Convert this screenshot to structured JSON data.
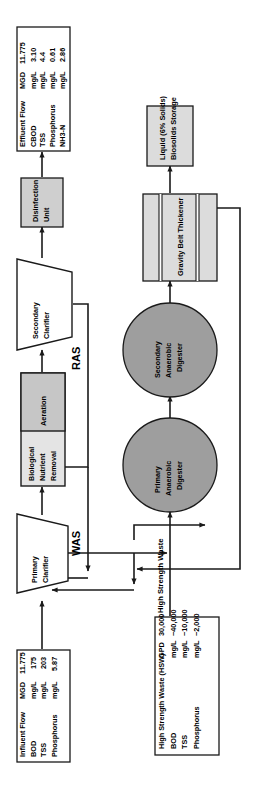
{
  "diagram": {
    "orientation": "rotated-90-clockwise",
    "colors": {
      "box_fill_light": "#e0e0e0",
      "box_fill_mid": "#c8c8c8",
      "digester_fill": "#9e9e9e",
      "data_box_fill": "#ffffff",
      "stroke": "#1a1a1a"
    }
  },
  "units": [
    {
      "id": "primary-clarifier",
      "label_lines": [
        "Primary",
        "Clarifier"
      ],
      "shape": "trapezoid"
    },
    {
      "id": "biological-nutrient-removal",
      "label_lines": [
        "Biological",
        "Nutrient",
        "Removal"
      ],
      "shape": "rect"
    },
    {
      "id": "aeration",
      "label_lines": [
        "Aeration"
      ],
      "shape": "rect"
    },
    {
      "id": "secondary-clarifier",
      "label_lines": [
        "Secondary",
        "Clarifier"
      ],
      "shape": "trapezoid"
    },
    {
      "id": "disinfection-unit",
      "label_lines": [
        "Disinfection",
        "Unit"
      ],
      "shape": "rect"
    },
    {
      "id": "primary-anaerobic-digester",
      "label_lines": [
        "Primary",
        "Anaerobic",
        "Digester"
      ],
      "shape": "circle"
    },
    {
      "id": "secondary-anaerobic-digester",
      "label_lines": [
        "Secondary",
        "Anaerobic",
        "Digester"
      ],
      "shape": "circle"
    },
    {
      "id": "gravity-belt-thickener",
      "label_lines": [
        "Gravity Belt Thickener"
      ],
      "shape": "rect-banded"
    },
    {
      "id": "biosolids-storage",
      "label_lines": [
        "Liquid (6% Solids)",
        "Biosolids Storage"
      ],
      "shape": "rect"
    }
  ],
  "streams": [
    {
      "id": "ras",
      "label": "RAS"
    },
    {
      "id": "was",
      "label": "WAS"
    },
    {
      "id": "was-hsw",
      "label": "WAS & High Strength Waste"
    }
  ],
  "data_boxes": {
    "influent": {
      "title": "Influent Flow",
      "title_unit": "MGD",
      "title_value": "11.775",
      "rows": [
        {
          "param": "BOD",
          "unit": "mg/L",
          "value": "175"
        },
        {
          "param": "TSS",
          "unit": "mg/L",
          "value": "203"
        },
        {
          "param": "Phosphorus",
          "unit": "mg/L",
          "value": "5.87"
        }
      ]
    },
    "hsw": {
      "title": "High Strength Waste (HSW)",
      "title_unit": "GPD",
      "title_value": "30,000",
      "rows": [
        {
          "param": "BOD",
          "unit": "mg/L",
          "value": "~40,000"
        },
        {
          "param": "TSS",
          "unit": "mg/L",
          "value": "~10,000"
        },
        {
          "param": "Phosphorus",
          "unit": "mg/L",
          "value": "~2,000"
        }
      ]
    },
    "effluent": {
      "title": "Effluent Flow",
      "title_unit": "MGD",
      "title_value": "11.775",
      "rows": [
        {
          "param": "CBOD",
          "unit": "mg/L",
          "value": "3.10"
        },
        {
          "param": "TSS",
          "unit": "mg/L",
          "value": "4.4"
        },
        {
          "param": "Phosphorus",
          "unit": "mg/L",
          "value": "0.61"
        },
        {
          "param": "NH3-N",
          "unit": "mg/L",
          "value": "2.86"
        }
      ]
    }
  },
  "text": {
    "influent_title": "Influent Flow",
    "influent_title_unit": "MGD",
    "influent_title_value": "11.775",
    "influent_r1_param": "BOD",
    "influent_r1_unit": "mg/L",
    "influent_r1_value": "175",
    "influent_r2_param": "TSS",
    "influent_r2_unit": "mg/L",
    "influent_r2_value": "203",
    "influent_r3_param": "Phosphorus",
    "influent_r3_unit": "mg/L",
    "influent_r3_value": "5.87",
    "hsw_title": "High Strength Waste (HSW)",
    "hsw_title_unit": "GPD",
    "hsw_title_value": "30,000",
    "hsw_r1_param": "BOD",
    "hsw_r1_unit": "mg/L",
    "hsw_r1_value": "~40,000",
    "hsw_r2_param": "TSS",
    "hsw_r2_unit": "mg/L",
    "hsw_r2_value": "~10,000",
    "hsw_r3_param": "Phosphorus",
    "hsw_r3_unit": "mg/L",
    "hsw_r3_value": "~2,000",
    "eff_title": "Effluent Flow",
    "eff_title_unit": "MGD",
    "eff_title_value": "11.775",
    "eff_r1_param": "CBOD",
    "eff_r1_unit": "mg/L",
    "eff_r1_value": "3.10",
    "eff_r2_param": "TSS",
    "eff_r2_unit": "mg/L",
    "eff_r2_value": "4.4",
    "eff_r3_param": "Phosphorus",
    "eff_r3_unit": "mg/L",
    "eff_r3_value": "0.61",
    "eff_r4_param": "NH3-N",
    "eff_r4_unit": "mg/L",
    "eff_r4_value": "2.86",
    "primary_clarifier_l1": "Primary",
    "primary_clarifier_l2": "Clarifier",
    "bnr_l1": "Biological",
    "bnr_l2": "Nutrient",
    "bnr_l3": "Removal",
    "aeration_l1": "Aeration",
    "secondary_clarifier_l1": "Secondary",
    "secondary_clarifier_l2": "Clarifier",
    "disinfection_l1": "Disinfection",
    "disinfection_l2": "Unit",
    "primary_digester_l1": "Primary",
    "primary_digester_l2": "Anaerobic",
    "primary_digester_l3": "Digester",
    "secondary_digester_l1": "Secondary",
    "secondary_digester_l2": "Anaerobic",
    "secondary_digester_l3": "Digester",
    "gbt_l1": "Gravity Belt Thickener",
    "biosolids_l1": "Liquid (6% Solids)",
    "biosolids_l2": "Biosolids Storage",
    "ras_label": "RAS",
    "was_label": "WAS",
    "was_hsw_label": "WAS & High Strength Waste"
  }
}
